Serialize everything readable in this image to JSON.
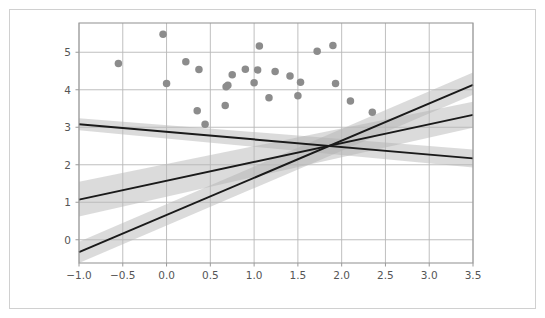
{
  "figure": {
    "background_color": "#ffffff",
    "border_color": "#d0d0d0",
    "axes_color": "#9a9a9a",
    "grid_color": "#b8b8b8"
  },
  "chart_data": {
    "type": "scatter",
    "title": "",
    "xlabel": "",
    "ylabel": "",
    "xlim": [
      -1.0,
      3.5
    ],
    "ylim": [
      -0.62,
      5.78
    ],
    "grid": true,
    "legend": "none",
    "xticks": [
      "-1.0",
      "-0.5",
      "0.0",
      "0.5",
      "1.0",
      "1.5",
      "2.0",
      "2.5",
      "3.0",
      "3.5"
    ],
    "xtick_values": [
      -1.0,
      -0.5,
      0.0,
      0.5,
      1.0,
      1.5,
      2.0,
      2.5,
      3.0,
      3.5
    ],
    "yticks": [
      "0",
      "1",
      "2",
      "3",
      "4",
      "5"
    ],
    "ytick_values": [
      0,
      1,
      2,
      3,
      4,
      5
    ],
    "point_color": "#8c8c8c",
    "point_size": 7.5,
    "points": [
      {
        "x": -0.55,
        "y": 4.7
      },
      {
        "x": -0.04,
        "y": 5.48
      },
      {
        "x": 0.0,
        "y": 4.17
      },
      {
        "x": 0.22,
        "y": 4.75
      },
      {
        "x": 0.35,
        "y": 3.44
      },
      {
        "x": 0.37,
        "y": 4.54
      },
      {
        "x": 0.44,
        "y": 3.08
      },
      {
        "x": 0.67,
        "y": 3.58
      },
      {
        "x": 0.68,
        "y": 4.08
      },
      {
        "x": 0.7,
        "y": 4.12
      },
      {
        "x": 0.75,
        "y": 4.4
      },
      {
        "x": 0.9,
        "y": 4.55
      },
      {
        "x": 1.0,
        "y": 4.19
      },
      {
        "x": 1.04,
        "y": 4.53
      },
      {
        "x": 1.06,
        "y": 5.17
      },
      {
        "x": 1.17,
        "y": 3.79
      },
      {
        "x": 1.24,
        "y": 4.49
      },
      {
        "x": 1.41,
        "y": 4.37
      },
      {
        "x": 1.5,
        "y": 3.84
      },
      {
        "x": 1.53,
        "y": 4.2
      },
      {
        "x": 1.72,
        "y": 5.03
      },
      {
        "x": 1.9,
        "y": 5.18
      },
      {
        "x": 1.93,
        "y": 4.17
      },
      {
        "x": 2.1,
        "y": 3.7
      },
      {
        "x": 2.35,
        "y": 3.4
      }
    ],
    "line_color": "#1a1a1a",
    "band_color": "#b0b0b0",
    "band_opacity": 0.45,
    "series": [
      {
        "name": "line-1",
        "x": [
          -1.0,
          3.5
        ],
        "y": [
          3.08,
          2.17
        ],
        "band_lower": [
          2.92,
          1.93
        ],
        "band_upper": [
          3.24,
          2.41
        ]
      },
      {
        "name": "line-2",
        "x": [
          -1.0,
          3.5
        ],
        "y": [
          1.07,
          3.33
        ],
        "band_lower": [
          0.62,
          2.99
        ],
        "band_upper": [
          1.55,
          3.68
        ]
      },
      {
        "name": "line-3",
        "x": [
          -1.0,
          3.5
        ],
        "y": [
          -0.33,
          4.13
        ],
        "band_lower": [
          -0.62,
          3.87
        ],
        "band_upper": [
          -0.05,
          4.46
        ]
      }
    ],
    "intersection": {
      "x": 1.83,
      "y": 2.52
    }
  }
}
